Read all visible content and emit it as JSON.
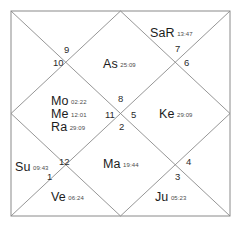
{
  "chart_title": "North Indian Vedic Birth Chart",
  "chart_data": {
    "type": "diagram",
    "style": "north-indian-kundali",
    "title": "",
    "frame": {
      "stroke_color": "#8a8a8a",
      "background": "#ffffff",
      "outer_border": true,
      "diagonals": true,
      "inner_diamond": true
    },
    "house_numbers": [
      {
        "id": "house-1",
        "label": "1",
        "x": 47,
        "y": 172
      },
      {
        "id": "house-2",
        "label": "2",
        "x": 119,
        "y": 122
      },
      {
        "id": "house-3",
        "label": "3",
        "x": 175,
        "y": 172
      },
      {
        "id": "house-4",
        "label": "4",
        "x": 186,
        "y": 157
      },
      {
        "id": "house-5",
        "label": "5",
        "x": 131,
        "y": 110
      },
      {
        "id": "house-6",
        "label": "6",
        "x": 184,
        "y": 58
      },
      {
        "id": "house-7",
        "label": "7",
        "x": 175,
        "y": 44
      },
      {
        "id": "house-8",
        "label": "8",
        "x": 118,
        "y": 94
      },
      {
        "id": "house-9",
        "label": "9",
        "x": 64,
        "y": 45
      },
      {
        "id": "house-10",
        "label": "10",
        "x": 53,
        "y": 58
      },
      {
        "id": "house-11",
        "label": "11",
        "x": 105,
        "y": 110
      },
      {
        "id": "house-12",
        "label": "12",
        "x": 59,
        "y": 157
      }
    ],
    "planets": [
      {
        "id": "saturn-retrograde",
        "name": "SaR",
        "degree": "13:47",
        "house": "7",
        "x": 150,
        "y": 24
      },
      {
        "id": "ascendant",
        "name": "As",
        "degree": "25:09",
        "house": "8",
        "x": 103,
        "y": 55
      },
      {
        "id": "moon",
        "name": "Mo",
        "degree": "02:22",
        "house": "11",
        "x": 51,
        "y": 92
      },
      {
        "id": "mercury",
        "name": "Me",
        "degree": "12:01",
        "house": "11",
        "x": 51,
        "y": 105
      },
      {
        "id": "rahu",
        "name": "Ra",
        "degree": "29:09",
        "house": "11",
        "x": 51,
        "y": 118
      },
      {
        "id": "ketu",
        "name": "Ke",
        "degree": "29:09",
        "house": "5",
        "x": 159,
        "y": 105
      },
      {
        "id": "sun",
        "name": "Su",
        "degree": "09:43",
        "house": "12",
        "x": 15,
        "y": 158
      },
      {
        "id": "mars",
        "name": "Ma",
        "degree": "19:44",
        "house": "2",
        "x": 103,
        "y": 155
      },
      {
        "id": "venus",
        "name": "Ve",
        "degree": "06:24",
        "house": "1",
        "x": 51,
        "y": 188
      },
      {
        "id": "jupiter",
        "name": "Ju",
        "degree": "05:23",
        "house": "3",
        "x": 155,
        "y": 188
      }
    ]
  }
}
